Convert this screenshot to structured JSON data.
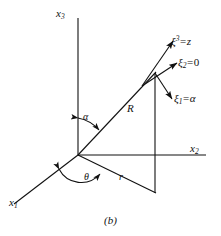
{
  "figure": {
    "caption": "(b)",
    "axes": {
      "x3": {
        "label": "x",
        "sub": "3"
      },
      "x2": {
        "label": "x",
        "sub": "2"
      },
      "x1": {
        "label": "x",
        "sub": "1"
      }
    },
    "angles": {
      "alpha": "α",
      "theta": "θ"
    },
    "lengths": {
      "R": "R",
      "r": "r"
    },
    "vectors": [
      {
        "symbol": "ξ",
        "sup": "3",
        "sub": "",
        "equals": "=",
        "value": "z",
        "name": "xi3-equals-z"
      },
      {
        "symbol": "ξ",
        "sup": "",
        "sub": "2",
        "equals": "=",
        "value": "0",
        "name": "xi2-equals-0"
      },
      {
        "symbol": "ξ",
        "sup": "",
        "sub": "1",
        "equals": "=",
        "value": "α",
        "name": "xi1-equals-alpha"
      }
    ],
    "colors": {
      "line": "#111111",
      "background": "#ffffff",
      "text": "#111111"
    },
    "geometry": {
      "origin": [
        78,
        155
      ],
      "x3_tip": [
        78,
        18
      ],
      "x2_tip": [
        205,
        155
      ],
      "x1_tip": [
        15,
        203
      ],
      "apex": [
        155,
        73
      ],
      "foot": [
        155,
        193
      ]
    }
  }
}
